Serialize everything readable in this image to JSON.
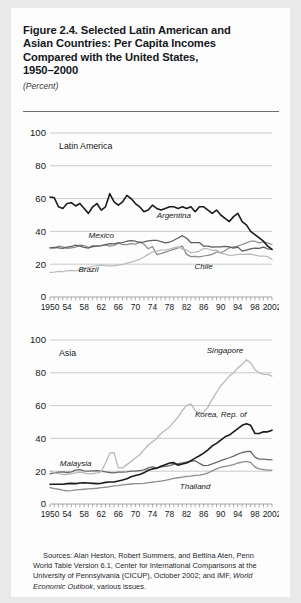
{
  "figure": {
    "title_lines": [
      "Figure 2.4.  Selected Latin American and",
      "Asian Countries: Per Capita Incomes",
      "Compared with the United States,",
      "1950–2000"
    ],
    "units": "(Percent)"
  },
  "source": {
    "line1": "Sources: Alan Heston, Robert Summers, and Bettina Aten, Penn",
    "line2": "World Table Version 6.1, Center for International Comparisons at",
    "line3": "the University of Pennsylvania (CICUP), October 2002; and IMF,",
    "line4_italic": "World Economic Outlook",
    "line4_rest": ", various issues."
  },
  "chart_data": [
    {
      "type": "line",
      "title": "Latin America",
      "xlabel": "",
      "ylabel": "",
      "ylim": [
        0,
        100
      ],
      "yticks": [
        0,
        20,
        40,
        60,
        80,
        100
      ],
      "xlim": [
        1950,
        2002
      ],
      "xticks": [
        1950,
        1954,
        1958,
        1962,
        1966,
        1970,
        1974,
        1978,
        1982,
        1986,
        1990,
        1994,
        1998,
        2002
      ],
      "xticklabels": [
        "1950",
        "54",
        "58",
        "62",
        "66",
        "70",
        "74",
        "78",
        "82",
        "86",
        "90",
        "94",
        "98",
        "2002"
      ],
      "grid": "horizontal",
      "legend": "inline-annotations",
      "x": [
        1950,
        1951,
        1952,
        1953,
        1954,
        1955,
        1956,
        1957,
        1958,
        1959,
        1960,
        1961,
        1962,
        1963,
        1964,
        1965,
        1966,
        1967,
        1968,
        1969,
        1970,
        1971,
        1972,
        1973,
        1974,
        1975,
        1976,
        1977,
        1978,
        1979,
        1980,
        1981,
        1982,
        1983,
        1984,
        1985,
        1986,
        1987,
        1988,
        1989,
        1990,
        1991,
        1992,
        1993,
        1994,
        1995,
        1996,
        1997,
        1998,
        1999,
        2000,
        2001,
        2002
      ],
      "series": [
        {
          "name": "Argentina",
          "color": "#1b1b1b",
          "width": 1.6,
          "label_x": 1979,
          "label_y": 48,
          "values": [
            61,
            60.5,
            55,
            54,
            57,
            57.5,
            55.5,
            57,
            54,
            51,
            55,
            57,
            53,
            55,
            63,
            58,
            56,
            58,
            62,
            60,
            57,
            55,
            52,
            53,
            56,
            54,
            53,
            54,
            55,
            55,
            54,
            55,
            54,
            55,
            52,
            55,
            55,
            53,
            51,
            53,
            50,
            48,
            46,
            49,
            51,
            46,
            44,
            40,
            38,
            36,
            34,
            31,
            29,
            27,
            29,
            31,
            34,
            37,
            36,
            38,
            37,
            36,
            34,
            30,
            28
          ]
        },
        {
          "name": "Mexico",
          "color": "#5d5d5d",
          "width": 1.25,
          "label_x": 1962,
          "label_y": 36,
          "values": [
            30,
            30.2,
            30,
            29.6,
            30.4,
            30.8,
            31.6,
            31,
            30.2,
            29.8,
            31.2,
            31,
            31.4,
            32,
            32.6,
            32.4,
            33,
            33.2,
            34,
            34.4,
            34,
            33.2,
            33.6,
            34.2,
            34.6,
            34.6,
            33.8,
            33,
            33.4,
            34.6,
            36,
            37.4,
            35.8,
            33.2,
            33.2,
            33.2,
            31,
            31,
            30.4,
            30.6,
            30.6,
            30.8,
            30.6,
            29.8,
            30.4,
            28,
            28.6,
            29.4,
            29.8,
            29.6,
            30.4,
            29.4,
            29
          ]
        },
        {
          "name": "Brazil",
          "color": "#b9b9b9",
          "width": 1.25,
          "label_x": 1959,
          "label_y": 15,
          "values": [
            15,
            15.2,
            15.6,
            15.4,
            16,
            16.2,
            16,
            16.6,
            17.4,
            18,
            18.6,
            19.2,
            19.6,
            19.2,
            19,
            19,
            19.6,
            19.8,
            20.6,
            21.2,
            22,
            23,
            24.4,
            26,
            27.4,
            28,
            28.6,
            28.8,
            29.2,
            30,
            30.6,
            29.2,
            28.8,
            27,
            27.4,
            28,
            29.6,
            29.4,
            28.4,
            28.6,
            26.8,
            26.2,
            25.4,
            25.6,
            26,
            26,
            26,
            26.2,
            25.6,
            25,
            25,
            24.6,
            23
          ]
        },
        {
          "name": "Chile",
          "color": "#8c8c8c",
          "width": 1.25,
          "label_x": 1986,
          "label_y": 17,
          "values": [
            30,
            29.8,
            31,
            30.6,
            29.6,
            30,
            30.4,
            31.6,
            31.4,
            30.2,
            30.6,
            31,
            31.2,
            31.8,
            31,
            31.4,
            32.8,
            32,
            32,
            32.6,
            32.2,
            33.6,
            32.2,
            29.4,
            30.8,
            26,
            26.4,
            27.4,
            28.2,
            29,
            30,
            31,
            26,
            24.6,
            24.8,
            24.4,
            25,
            25.4,
            26,
            27.4,
            27,
            28.2,
            30,
            30.6,
            31,
            32,
            33,
            34,
            34,
            33,
            33.6,
            32.8,
            32
          ]
        }
      ]
    },
    {
      "type": "line",
      "title": "Asia",
      "xlabel": "",
      "ylabel": "",
      "ylim": [
        0,
        100
      ],
      "yticks": [
        0,
        20,
        40,
        60,
        80,
        100
      ],
      "xlim": [
        1950,
        2002
      ],
      "xticks": [
        1950,
        1954,
        1958,
        1962,
        1966,
        1970,
        1974,
        1978,
        1982,
        1986,
        1990,
        1994,
        1998,
        2002
      ],
      "xticklabels": [
        "1950",
        "54",
        "58",
        "62",
        "66",
        "70",
        "74",
        "78",
        "82",
        "86",
        "90",
        "94",
        "98",
        "2002"
      ],
      "grid": "horizontal",
      "legend": "inline-annotations",
      "x": [
        1950,
        1951,
        1952,
        1953,
        1954,
        1955,
        1956,
        1957,
        1958,
        1959,
        1960,
        1961,
        1962,
        1963,
        1964,
        1965,
        1966,
        1967,
        1968,
        1969,
        1970,
        1971,
        1972,
        1973,
        1974,
        1975,
        1976,
        1977,
        1978,
        1979,
        1980,
        1981,
        1982,
        1983,
        1984,
        1985,
        1986,
        1987,
        1988,
        1989,
        1990,
        1991,
        1992,
        1993,
        1994,
        1995,
        1996,
        1997,
        1998,
        1999,
        2000,
        2001,
        2002
      ],
      "series": [
        {
          "name": "Singapore",
          "color": "#b9b9b9",
          "width": 1.3,
          "label_x": 1991,
          "label_y": 92,
          "values": [
            20,
            19,
            18.5,
            18,
            18,
            18.6,
            19,
            19.4,
            19,
            18.4,
            18.6,
            19,
            19.6,
            25,
            31,
            31.4,
            22,
            22,
            24,
            26,
            28,
            30,
            33,
            36,
            38,
            40,
            43,
            45,
            47,
            50,
            53,
            57,
            60,
            61,
            57,
            55,
            56,
            59,
            64,
            68,
            72,
            75,
            78,
            80,
            83,
            85,
            88,
            86,
            82,
            80,
            79,
            79,
            78
          ]
        },
        {
          "name": "Korea, Rep. of",
          "color": "#1b1b1b",
          "width": 1.6,
          "label_x": 1990,
          "label_y": 53,
          "values": [
            12,
            12,
            12,
            12,
            12.4,
            12.6,
            12.4,
            12.8,
            13,
            12.8,
            12.6,
            12.4,
            12.6,
            13.2,
            13.4,
            13.4,
            14,
            14.6,
            15.4,
            16.6,
            17.4,
            18,
            19,
            20.6,
            21.4,
            21.8,
            23,
            24,
            25,
            25.2,
            23.6,
            24.4,
            25,
            26.4,
            28,
            29.4,
            31,
            33,
            35.4,
            37,
            39,
            41,
            42,
            44,
            46,
            48,
            49,
            48,
            43,
            43,
            44,
            44,
            45
          ]
        },
        {
          "name": "Malaysia",
          "color": "#6a6a6a",
          "width": 1.3,
          "label_x": 1956,
          "label_y": 23,
          "values": [
            18.4,
            19,
            19.4,
            19.6,
            19.2,
            19.6,
            20.6,
            21,
            20.2,
            20,
            20.2,
            20.4,
            20,
            19.6,
            19.2,
            19,
            19.4,
            19.4,
            19.6,
            20,
            20,
            20.4,
            20.8,
            22,
            22.6,
            22,
            22.6,
            23,
            23.4,
            24.2,
            24.6,
            25,
            25.6,
            26,
            26.4,
            24.8,
            23.4,
            23.6,
            24.4,
            25.4,
            26.4,
            27.4,
            28.2,
            29.2,
            30.4,
            31.4,
            32,
            32,
            28.6,
            27.4,
            27.4,
            27,
            27
          ]
        },
        {
          "name": "Thailand",
          "color": "#8c8c8c",
          "width": 1.3,
          "label_x": 1984,
          "label_y": 9,
          "values": [
            10,
            9.4,
            9,
            8.4,
            8,
            8.2,
            8.6,
            8.8,
            9,
            9.2,
            9.4,
            9.6,
            10,
            10.2,
            10.6,
            11,
            11.2,
            11.6,
            12,
            12.2,
            12.4,
            12.4,
            12.6,
            13,
            13.4,
            13.6,
            14,
            14.4,
            15,
            15.6,
            16,
            16.4,
            16.8,
            17,
            17.4,
            17.6,
            18,
            19,
            20.2,
            21.4,
            22.4,
            23,
            23.4,
            24,
            25,
            25.6,
            26,
            25.4,
            22.6,
            21.4,
            21,
            20.6,
            20.6
          ]
        }
      ]
    }
  ]
}
